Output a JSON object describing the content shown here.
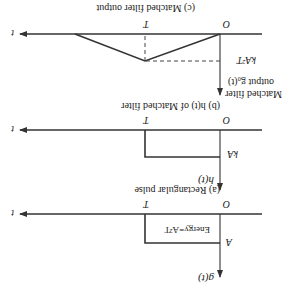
{
  "diagram": {
    "orientation": "rotated 180 degrees",
    "panels": {
      "a": {
        "caption": "(a) Rectangular pulse",
        "y_label": "g(t)",
        "amplitude_label": "A",
        "origin_label": "O",
        "T_label": "T",
        "t_label": "t",
        "inner_label": "Energy=A²T"
      },
      "b": {
        "caption": "(b) h(t) of Matched filter",
        "y_label": "h(t)",
        "amplitude_label": "kA",
        "origin_label": "O",
        "T_label": "T",
        "t_label": "t"
      },
      "c": {
        "caption": "(c) Matched filter output",
        "y_label_line1": "Matched filter",
        "y_label_line2": "output g₀(t)",
        "amplitude_label": "kA²T",
        "origin_label": "O",
        "T_label": "T",
        "t_label": "t"
      }
    }
  }
}
